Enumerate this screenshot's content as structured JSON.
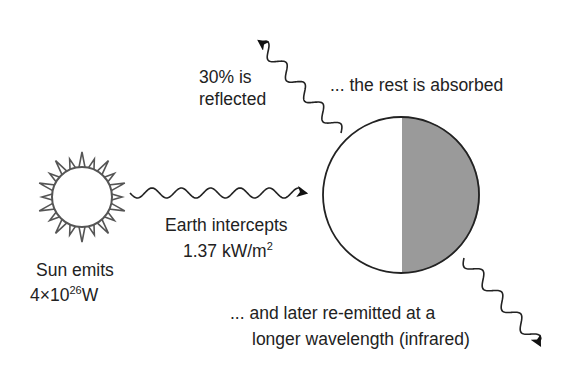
{
  "diagram": {
    "colors": {
      "stroke": "#222222",
      "sun_stroke": "#555555",
      "earth_shade": "#9a9a9a",
      "background": "#ffffff"
    },
    "sun": {
      "label_line1": "Sun emits",
      "label_line2_base": "4×10",
      "label_line2_exp": "26",
      "label_line2_unit": "W"
    },
    "incoming": {
      "label_line1": "Earth intercepts",
      "label_line2_base": "1.37 kW/m",
      "label_line2_exp": "2"
    },
    "reflected": {
      "label_line1": "30% is",
      "label_line2": "reflected"
    },
    "absorbed": {
      "label": "... the rest is absorbed"
    },
    "reemitted": {
      "label_line1": "... and later re-emitted at a",
      "label_line2": "longer wavelength (infrared)"
    }
  }
}
